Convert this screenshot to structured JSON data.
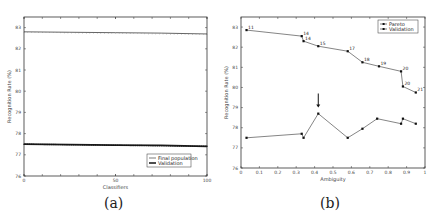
{
  "chart_data": [
    {
      "id": "a",
      "type": "line",
      "caption": "(a)",
      "title": "",
      "xlabel": "Classifiers",
      "ylabel": "Recognition Rate (%)",
      "xlim": [
        0,
        100
      ],
      "ylim": [
        76,
        83.5
      ],
      "xticks": [
        0,
        50,
        100
      ],
      "yticks": [
        76,
        77,
        78,
        79,
        80,
        81,
        82,
        83
      ],
      "grid": false,
      "legend_position": "lower right",
      "series": [
        {
          "name": "Final population",
          "marker": "none",
          "x": [
            0,
            25,
            50,
            75,
            100
          ],
          "values": [
            82.8,
            82.78,
            82.76,
            82.74,
            82.7
          ]
        },
        {
          "name": "Validation",
          "marker": "dot",
          "x": [
            0,
            25,
            50,
            75,
            100
          ],
          "values": [
            77.5,
            77.48,
            77.46,
            77.44,
            77.4
          ]
        }
      ]
    },
    {
      "id": "b",
      "type": "line",
      "caption": "(b)",
      "title": "",
      "xlabel": "Ambiguity",
      "ylabel": "Recognition Rate (%)",
      "xlim": [
        0,
        1
      ],
      "ylim": [
        76,
        83.5
      ],
      "xticks": [
        0,
        0.1,
        0.2,
        0.3,
        0.4,
        0.5,
        0.6,
        0.7,
        0.8,
        0.9,
        1
      ],
      "yticks": [
        76,
        77,
        78,
        79,
        80,
        81,
        82,
        83
      ],
      "grid": false,
      "legend_position": "upper right",
      "annotations": [
        {
          "type": "arrow",
          "x": 0.42,
          "y_from": 79.7,
          "y_to": 79.0,
          "direction": "down"
        }
      ],
      "series": [
        {
          "name": "Pareto",
          "marker": "square",
          "x": [
            0.03,
            0.33,
            0.34,
            0.42,
            0.58,
            0.66,
            0.75,
            0.87,
            0.88,
            0.95
          ],
          "values": [
            82.85,
            82.55,
            82.3,
            82.05,
            81.8,
            81.25,
            81.05,
            80.8,
            80.05,
            79.75
          ],
          "point_labels": [
            "11",
            "14",
            "14",
            "15",
            "17",
            "18",
            "19",
            "20",
            "20",
            "21"
          ]
        },
        {
          "name": "Validation",
          "marker": "square",
          "x": [
            0.03,
            0.33,
            0.34,
            0.42,
            0.58,
            0.66,
            0.74,
            0.87,
            0.88,
            0.95
          ],
          "values": [
            77.5,
            77.7,
            77.5,
            78.7,
            77.5,
            77.95,
            78.45,
            78.2,
            78.45,
            78.2
          ]
        }
      ]
    }
  ]
}
